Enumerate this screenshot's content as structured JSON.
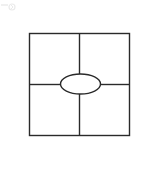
{
  "diagram": {
    "type": "four-square graphic organizer",
    "stroke_color": "#2a2a2a",
    "background_color": "#ffffff",
    "outer_square": {
      "x": 29,
      "y": 33,
      "width": 101,
      "height": 103
    },
    "vertical_divider_x": 79.5,
    "horizontal_divider_y": 84,
    "center_ellipse": {
      "cx": 80.5,
      "cy": 84,
      "rx": 20,
      "ry": 10
    },
    "quadrants": [
      {
        "position": "top-left",
        "label": ""
      },
      {
        "position": "top-right",
        "label": ""
      },
      {
        "position": "bottom-left",
        "label": ""
      },
      {
        "position": "bottom-right",
        "label": ""
      }
    ],
    "center_label": ""
  },
  "icons": {
    "corner": "arrow-icon"
  }
}
